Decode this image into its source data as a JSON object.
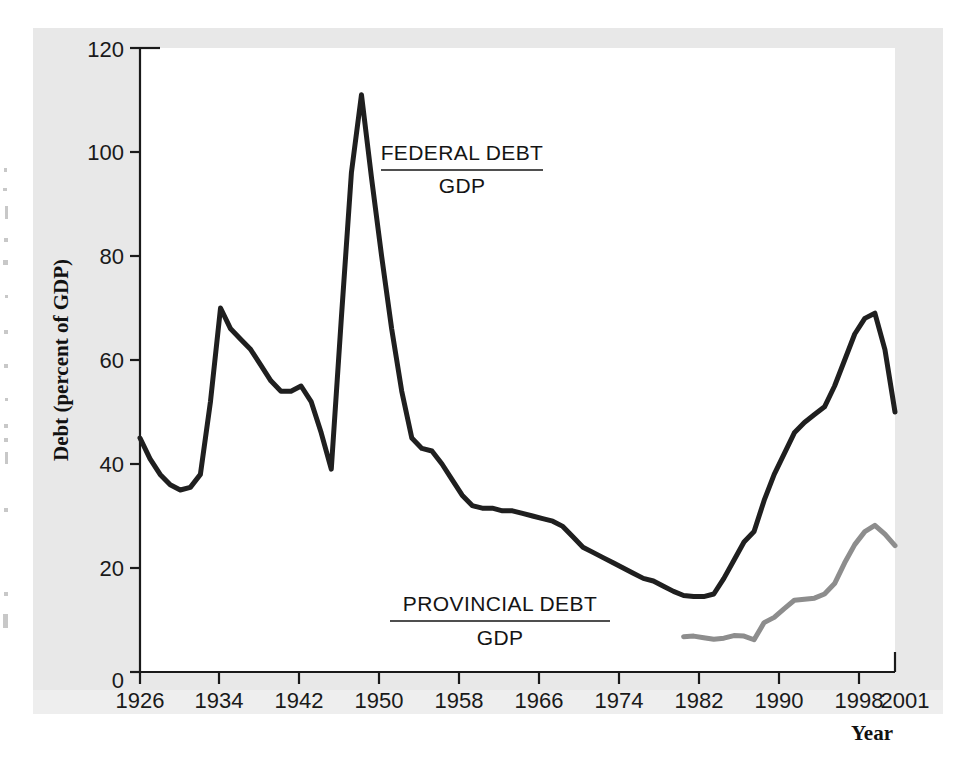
{
  "figure": {
    "background_color": "#e8e8e8",
    "plot_background_color": "#ffffff"
  },
  "annotations": [
    {
      "name": "federal-debt-label",
      "numerator": "FEDERAL DEBT",
      "denominator": "GDP"
    },
    {
      "name": "provincial-debt-label",
      "numerator": "PROVINCIAL DEBT",
      "denominator": "GDP"
    }
  ],
  "axes": {
    "x_title": "Year",
    "y_title": "Debt (percent of GDP)",
    "x_ticks": [
      "1926",
      "1934",
      "1942",
      "1950",
      "1958",
      "1966",
      "1974",
      "1982",
      "1990",
      "1998",
      "2001"
    ],
    "y_ticks": [
      "0",
      "20",
      "40",
      "60",
      "80",
      "100",
      "120"
    ]
  },
  "chart_data": {
    "type": "line",
    "title": "",
    "xlabel": "Year",
    "ylabel": "Debt (percent of GDP)",
    "xlim": [
      1926,
      2001
    ],
    "ylim": [
      0,
      120
    ],
    "grid": false,
    "legend_position": "inline-annotation",
    "xticks": [
      1926,
      1934,
      1942,
      1950,
      1958,
      1966,
      1974,
      1982,
      1990,
      1998,
      2001
    ],
    "yticks": [
      0,
      20,
      40,
      60,
      80,
      100,
      120
    ],
    "series": [
      {
        "name": "FEDERAL DEBT / GDP",
        "color": "#1f1f1f",
        "x": [
          1926,
          1927,
          1928,
          1929,
          1930,
          1931,
          1932,
          1933,
          1934,
          1935,
          1936,
          1937,
          1938,
          1939,
          1940,
          1941,
          1942,
          1943,
          1944,
          1945,
          1946,
          1947,
          1948,
          1949,
          1950,
          1951,
          1952,
          1953,
          1954,
          1955,
          1956,
          1957,
          1958,
          1959,
          1960,
          1961,
          1962,
          1963,
          1964,
          1965,
          1966,
          1967,
          1968,
          1969,
          1970,
          1971,
          1972,
          1973,
          1974,
          1975,
          1976,
          1977,
          1978,
          1979,
          1980,
          1981,
          1982,
          1983,
          1984,
          1985,
          1986,
          1987,
          1988,
          1989,
          1990,
          1991,
          1992,
          1993,
          1994,
          1995,
          1996,
          1997,
          1998,
          1999,
          2000,
          2001
        ],
        "y": [
          45,
          41,
          38,
          36,
          35,
          35.5,
          38,
          52,
          70,
          66,
          64,
          62,
          59,
          56,
          54,
          54,
          55,
          52,
          46,
          39,
          68,
          96,
          111,
          95,
          80,
          66,
          54,
          45,
          43,
          42.5,
          40,
          37,
          34,
          32,
          31.5,
          31.5,
          31,
          31,
          30.5,
          30,
          29.5,
          29,
          28,
          26,
          24,
          23,
          22,
          21,
          20,
          19,
          18,
          17.5,
          16.5,
          15.5,
          14.7,
          14.5,
          14.5,
          15,
          18,
          21.5,
          25,
          27,
          33,
          38,
          42,
          46,
          48,
          49.5,
          51,
          55,
          60,
          65,
          68,
          69,
          62,
          50
        ]
      },
      {
        "name": "PROVINCIAL DEBT / GDP",
        "color": "#8d8d8d",
        "x": [
          1980,
          1981,
          1982,
          1983,
          1984,
          1985,
          1986,
          1987,
          1988,
          1989,
          1990,
          1991,
          1992,
          1993,
          1994,
          1995,
          1996,
          1997,
          1998,
          1999,
          2000,
          2001
        ],
        "y": [
          6.8,
          6.9,
          6.6,
          6.3,
          6.5,
          7.0,
          6.9,
          6.2,
          9.5,
          10.5,
          12.2,
          13.8,
          14.0,
          14.2,
          15.0,
          17.0,
          21.0,
          24.5,
          27.0,
          28.2,
          26.5,
          24.3
        ]
      }
    ]
  }
}
